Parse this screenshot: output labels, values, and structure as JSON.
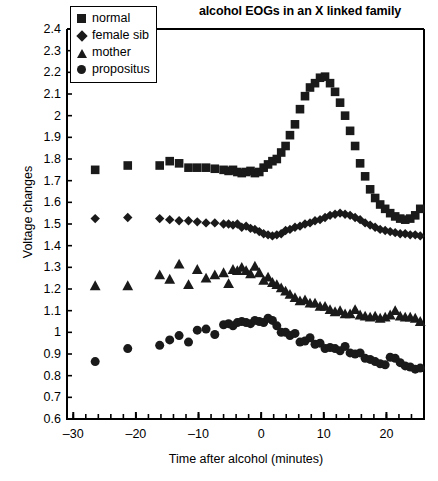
{
  "chart_data": {
    "type": "scatter",
    "title": "alcohol EOGs in an X linked family",
    "xlabel": "Time after alcohol (minutes)",
    "ylabel": "Voltage changes",
    "xlim": [
      -31,
      26
    ],
    "ylim": [
      0.6,
      2.4
    ],
    "grid": false,
    "legend_position": "top-left-inside",
    "xticks": [
      -30,
      -20,
      -10,
      0,
      10,
      20
    ],
    "xtick_labels": [
      "-30",
      "-20",
      "-10",
      "0",
      "10",
      "20"
    ],
    "xtick_minor_step": 2,
    "yticks": [
      0.6,
      0.7,
      0.8,
      0.9,
      1.0,
      1.1,
      1.2,
      1.3,
      1.4,
      1.5,
      1.6,
      1.7,
      1.8,
      1.9,
      2.0,
      2.1,
      2.2,
      2.3,
      2.4
    ],
    "ytick_labels": [
      "0.6",
      "0.7",
      "0.8",
      "0.9",
      "1",
      "1.1",
      "1.2",
      "1.3",
      "1.4",
      "1.5",
      "1.6",
      "1.7",
      "1.8",
      "1.9",
      "2",
      "2.1",
      "2.2",
      "2.3",
      "2.4"
    ],
    "marker_color": "#1a1a1a",
    "series": [
      {
        "name": "normal",
        "marker": "square",
        "points": [
          [
            -26.5,
            1.75
          ],
          [
            -21.3,
            1.77
          ],
          [
            -16.2,
            1.77
          ],
          [
            -14.6,
            1.79
          ],
          [
            -13.1,
            1.78
          ],
          [
            -11.6,
            1.76
          ],
          [
            -10.2,
            1.76
          ],
          [
            -8.8,
            1.76
          ],
          [
            -7.4,
            1.755
          ],
          [
            -6.0,
            1.75
          ],
          [
            -5.2,
            1.745
          ],
          [
            -4.5,
            1.75
          ],
          [
            -3.8,
            1.74
          ],
          [
            -3.1,
            1.735
          ],
          [
            -2.4,
            1.74
          ],
          [
            -1.7,
            1.745
          ],
          [
            -1.0,
            1.735
          ],
          [
            -0.3,
            1.74
          ],
          [
            0.4,
            1.76
          ],
          [
            1.1,
            1.775
          ],
          [
            1.8,
            1.79
          ],
          [
            2.5,
            1.8
          ],
          [
            3.2,
            1.83
          ],
          [
            3.9,
            1.86
          ],
          [
            4.6,
            1.91
          ],
          [
            5.4,
            1.96
          ],
          [
            6.2,
            2.03
          ],
          [
            7.0,
            2.09
          ],
          [
            7.8,
            2.13
          ],
          [
            8.6,
            2.15
          ],
          [
            9.4,
            2.175
          ],
          [
            10.2,
            2.18
          ],
          [
            11.0,
            2.15
          ],
          [
            11.8,
            2.11
          ],
          [
            12.6,
            2.06
          ],
          [
            13.4,
            2.0
          ],
          [
            14.2,
            1.93
          ],
          [
            15.0,
            1.86
          ],
          [
            15.8,
            1.78
          ],
          [
            16.6,
            1.72
          ],
          [
            17.4,
            1.66
          ],
          [
            18.2,
            1.62
          ],
          [
            19.0,
            1.59
          ],
          [
            19.8,
            1.57
          ],
          [
            20.6,
            1.55
          ],
          [
            21.4,
            1.535
          ],
          [
            22.2,
            1.525
          ],
          [
            23.0,
            1.52
          ],
          [
            23.8,
            1.525
          ],
          [
            24.6,
            1.54
          ],
          [
            25.4,
            1.57
          ]
        ]
      },
      {
        "name": "female sib",
        "marker": "diamond",
        "points": [
          [
            -26.5,
            1.525
          ],
          [
            -21.3,
            1.53
          ],
          [
            -16.2,
            1.525
          ],
          [
            -14.6,
            1.52
          ],
          [
            -13.1,
            1.515
          ],
          [
            -11.6,
            1.515
          ],
          [
            -10.2,
            1.51
          ],
          [
            -8.8,
            1.505
          ],
          [
            -7.4,
            1.505
          ],
          [
            -6.0,
            1.5
          ],
          [
            -5.2,
            1.5
          ],
          [
            -4.5,
            1.495
          ],
          [
            -3.8,
            1.5
          ],
          [
            -3.1,
            1.485
          ],
          [
            -2.4,
            1.49
          ],
          [
            -1.7,
            1.48
          ],
          [
            -1.0,
            1.475
          ],
          [
            -0.3,
            1.465
          ],
          [
            0.4,
            1.455
          ],
          [
            1.1,
            1.45
          ],
          [
            1.8,
            1.445
          ],
          [
            2.5,
            1.45
          ],
          [
            3.2,
            1.455
          ],
          [
            3.9,
            1.47
          ],
          [
            4.6,
            1.475
          ],
          [
            5.4,
            1.485
          ],
          [
            6.2,
            1.49
          ],
          [
            7.0,
            1.5
          ],
          [
            7.8,
            1.505
          ],
          [
            8.6,
            1.515
          ],
          [
            9.4,
            1.52
          ],
          [
            10.2,
            1.53
          ],
          [
            11.0,
            1.54
          ],
          [
            11.8,
            1.545
          ],
          [
            12.6,
            1.55
          ],
          [
            13.4,
            1.545
          ],
          [
            14.2,
            1.54
          ],
          [
            15.0,
            1.53
          ],
          [
            15.8,
            1.52
          ],
          [
            16.6,
            1.505
          ],
          [
            17.4,
            1.495
          ],
          [
            18.2,
            1.485
          ],
          [
            19.0,
            1.475
          ],
          [
            19.8,
            1.47
          ],
          [
            20.6,
            1.465
          ],
          [
            21.4,
            1.46
          ],
          [
            22.2,
            1.455
          ],
          [
            23.0,
            1.455
          ],
          [
            23.8,
            1.45
          ],
          [
            24.6,
            1.45
          ],
          [
            25.4,
            1.445
          ]
        ]
      },
      {
        "name": "mother",
        "marker": "triangle",
        "points": [
          [
            -26.5,
            1.215
          ],
          [
            -21.3,
            1.215
          ],
          [
            -16.2,
            1.265
          ],
          [
            -14.6,
            1.245
          ],
          [
            -13.1,
            1.315
          ],
          [
            -11.6,
            1.22
          ],
          [
            -10.2,
            1.29
          ],
          [
            -8.8,
            1.25
          ],
          [
            -7.4,
            1.265
          ],
          [
            -6.0,
            1.275
          ],
          [
            -5.2,
            1.225
          ],
          [
            -4.5,
            1.29
          ],
          [
            -3.8,
            1.285
          ],
          [
            -3.1,
            1.3
          ],
          [
            -2.4,
            1.285
          ],
          [
            -1.7,
            1.27
          ],
          [
            -1.0,
            1.305
          ],
          [
            -0.3,
            1.275
          ],
          [
            0.4,
            1.24
          ],
          [
            1.1,
            1.255
          ],
          [
            1.8,
            1.23
          ],
          [
            2.5,
            1.22
          ],
          [
            3.2,
            1.205
          ],
          [
            3.9,
            1.19
          ],
          [
            4.6,
            1.175
          ],
          [
            5.4,
            1.16
          ],
          [
            6.2,
            1.145
          ],
          [
            7.0,
            1.15
          ],
          [
            7.8,
            1.135
          ],
          [
            8.6,
            1.135
          ],
          [
            9.4,
            1.12
          ],
          [
            10.2,
            1.12
          ],
          [
            11.0,
            1.105
          ],
          [
            11.8,
            1.095
          ],
          [
            12.6,
            1.1
          ],
          [
            13.4,
            1.085
          ],
          [
            14.2,
            1.085
          ],
          [
            15.0,
            1.105
          ],
          [
            15.8,
            1.08
          ],
          [
            16.6,
            1.075
          ],
          [
            17.4,
            1.07
          ],
          [
            18.2,
            1.075
          ],
          [
            19.0,
            1.065
          ],
          [
            19.8,
            1.07
          ],
          [
            20.6,
            1.08
          ],
          [
            21.4,
            1.1
          ],
          [
            22.2,
            1.075
          ],
          [
            23.0,
            1.07
          ],
          [
            23.8,
            1.07
          ],
          [
            24.6,
            1.065
          ],
          [
            25.4,
            1.05
          ]
        ]
      },
      {
        "name": "propositus",
        "marker": "circle",
        "points": [
          [
            -26.5,
            0.865
          ],
          [
            -21.3,
            0.925
          ],
          [
            -16.2,
            0.94
          ],
          [
            -14.6,
            0.965
          ],
          [
            -13.1,
            0.985
          ],
          [
            -11.6,
            0.955
          ],
          [
            -10.2,
            1.01
          ],
          [
            -8.8,
            1.015
          ],
          [
            -7.4,
            0.99
          ],
          [
            -6.0,
            1.035
          ],
          [
            -5.2,
            1.04
          ],
          [
            -4.5,
            1.03
          ],
          [
            -3.8,
            1.045
          ],
          [
            -3.1,
            1.05
          ],
          [
            -2.4,
            1.045
          ],
          [
            -1.7,
            1.04
          ],
          [
            -1.0,
            1.055
          ],
          [
            -0.3,
            1.05
          ],
          [
            0.4,
            1.045
          ],
          [
            1.1,
            1.065
          ],
          [
            1.8,
            1.055
          ],
          [
            2.5,
            1.03
          ],
          [
            3.2,
            1.0
          ],
          [
            3.9,
            1.0
          ],
          [
            4.6,
            0.985
          ],
          [
            5.4,
            0.995
          ],
          [
            6.2,
            0.955
          ],
          [
            7.0,
            0.96
          ],
          [
            7.8,
            0.975
          ],
          [
            8.6,
            0.945
          ],
          [
            9.4,
            0.95
          ],
          [
            10.2,
            0.925
          ],
          [
            11.0,
            0.93
          ],
          [
            11.8,
            0.925
          ],
          [
            12.6,
            0.915
          ],
          [
            13.4,
            0.935
          ],
          [
            14.2,
            0.905
          ],
          [
            15.0,
            0.9
          ],
          [
            15.8,
            0.905
          ],
          [
            16.6,
            0.88
          ],
          [
            17.4,
            0.875
          ],
          [
            18.2,
            0.865
          ],
          [
            19.0,
            0.855
          ],
          [
            19.8,
            0.85
          ],
          [
            20.6,
            0.885
          ],
          [
            21.4,
            0.88
          ],
          [
            22.2,
            0.86
          ],
          [
            23.0,
            0.845
          ],
          [
            23.8,
            0.84
          ],
          [
            24.6,
            0.83
          ],
          [
            25.4,
            0.835
          ]
        ]
      }
    ]
  },
  "legend": {
    "items": [
      {
        "label": "normal",
        "marker": "square"
      },
      {
        "label": "female sib",
        "marker": "diamond"
      },
      {
        "label": "mother",
        "marker": "triangle"
      },
      {
        "label": "propositus",
        "marker": "circle"
      }
    ]
  }
}
